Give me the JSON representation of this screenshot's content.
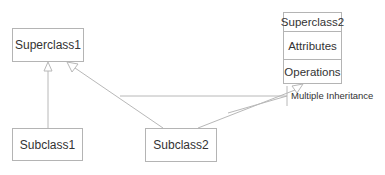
{
  "diagram": {
    "type": "UML class diagram",
    "classes": [
      {
        "id": "superclass1",
        "name": "Superclass1"
      },
      {
        "id": "superclass2",
        "name": "Superclass2",
        "compartments": [
          "Attributes",
          "Operations"
        ]
      },
      {
        "id": "subclass1",
        "name": "Subclass1"
      },
      {
        "id": "subclass2",
        "name": "Subclass2"
      }
    ],
    "relations": [
      {
        "from": "Subclass1",
        "to": "Superclass1",
        "kind": "generalization"
      },
      {
        "from": "Subclass2",
        "to": "Superclass1",
        "kind": "generalization"
      },
      {
        "from": "Subclass2",
        "to": "Superclass2",
        "kind": "generalization"
      }
    ],
    "note": {
      "label": "Multiple Inheritance"
    },
    "colors": {
      "line": "#b4b4b4",
      "text": "#333333",
      "background": "#ffffff"
    }
  }
}
